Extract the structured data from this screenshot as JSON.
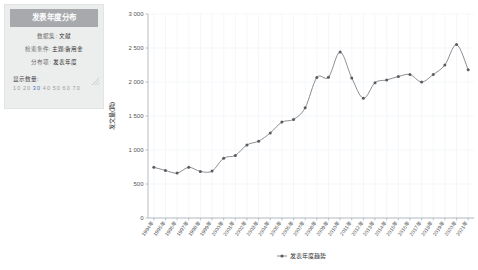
{
  "panel": {
    "title": "发表年度分布",
    "rows": [
      {
        "key": "数据集:",
        "value": "文献"
      },
      {
        "key": "检索条件:",
        "value": "主题:备用金"
      },
      {
        "key": "分布项:",
        "value": "发表年度"
      }
    ],
    "count_label": "显示数量:",
    "count_options": [
      "10",
      "20",
      "30",
      "40",
      "50",
      "60",
      "70"
    ],
    "count_selected": "30",
    "badge_icon": "resize-handle-icon"
  },
  "chart_data": {
    "type": "line",
    "title": "发表年度分布",
    "xlabel": "发表年度趋势",
    "ylabel": "发文量(篇)",
    "ylim": [
      0,
      3000
    ],
    "yticks": [
      0,
      500,
      1000,
      1500,
      2000,
      2500,
      3000
    ],
    "ytick_labels": [
      "0",
      "500",
      "1 000",
      "1 500",
      "2 000",
      "2 500",
      "3 000"
    ],
    "grid": true,
    "legend": [
      "发表年度趋势"
    ],
    "legend_position": "bottom",
    "series_color": "#7d7f83",
    "categories": [
      "1994年",
      "1995年",
      "1996年",
      "1997年",
      "1998年",
      "1999年",
      "2000年",
      "2001年",
      "2002年",
      "2003年",
      "2004年",
      "2005年",
      "2006年",
      "2007年",
      "2008年",
      "2009年",
      "2010年",
      "2011年",
      "2012年",
      "2013年",
      "2014年",
      "2015年",
      "2016年",
      "2017年",
      "2018年",
      "2019年",
      "2020年",
      "2021年"
    ],
    "series": [
      {
        "name": "发表年度趋势",
        "values": [
          745,
          700,
          660,
          745,
          685,
          690,
          880,
          920,
          1075,
          1130,
          1250,
          1410,
          1450,
          1620,
          2065,
          2070,
          2440,
          2060,
          1760,
          1990,
          2030,
          2080,
          2110,
          2000,
          2110,
          2250,
          2550,
          2180
        ]
      }
    ]
  }
}
